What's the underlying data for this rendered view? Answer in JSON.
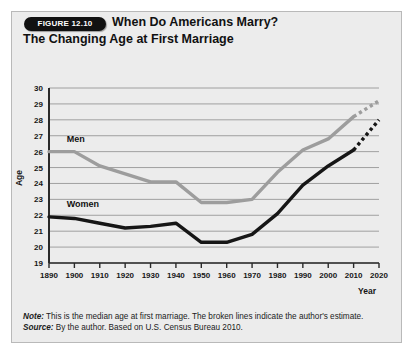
{
  "figure": {
    "badge": "FIGURE 12.10",
    "title_line1": "When Do Americans Marry?",
    "title_line2": "The Changing Age at First Marriage",
    "note_key": "Note:",
    "note_text": " This is the median age at first marriage. The broken lines indicate the author's estimate.",
    "source_key": "Source:",
    "source_text": " By the author. Based on U.S. Census Bureau 2010."
  },
  "chart_data": {
    "type": "line",
    "title": "When Do Americans Marry? The Changing Age at First Marriage",
    "xlabel": "Year",
    "ylabel": "Age",
    "xlim": [
      1890,
      2020
    ],
    "ylim": [
      19,
      30
    ],
    "grid": true,
    "legend_position": "inline-labels",
    "x": [
      1890,
      1900,
      1910,
      1920,
      1930,
      1940,
      1950,
      1960,
      1970,
      1980,
      1990,
      2000,
      2010,
      2020
    ],
    "xticklabels": [
      "1890",
      "1900",
      "1910",
      "1920",
      "1930",
      "1940",
      "1950",
      "1960",
      "1970",
      "1980",
      "1990",
      "2000",
      "2010",
      "2020"
    ],
    "yticklabels": [
      "19",
      "20",
      "21",
      "22",
      "23",
      "24",
      "25",
      "26",
      "27",
      "28",
      "29",
      "30"
    ],
    "series": [
      {
        "name": "Men",
        "color": "#9d9d9d",
        "style": "solid-then-dashed",
        "dash_starts_at": 2010,
        "values": [
          26.0,
          26.0,
          25.1,
          24.6,
          24.1,
          24.1,
          22.8,
          22.8,
          23.0,
          24.7,
          26.1,
          26.8,
          28.2,
          29.2
        ]
      },
      {
        "name": "Women",
        "color": "#161616",
        "style": "solid-then-dashed",
        "dash_starts_at": 2010,
        "values": [
          21.9,
          21.8,
          21.5,
          21.2,
          21.3,
          21.5,
          20.3,
          20.3,
          20.8,
          22.1,
          23.9,
          25.1,
          26.1,
          28.0
        ]
      }
    ],
    "annotations": [
      {
        "text": "Men",
        "x": 1897,
        "y": 26.6
      },
      {
        "text": "Women",
        "x": 1897,
        "y": 22.5
      }
    ]
  }
}
